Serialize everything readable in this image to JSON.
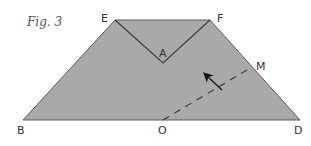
{
  "figure": {
    "caption": "Fig. 3",
    "colors": {
      "fill": "#a9a9a9",
      "edge": "#5a5a5a",
      "notch": "#3d3d3d",
      "dashed": "#333333",
      "arrow": "#111111",
      "label": "#333333",
      "background": "#ffffff"
    },
    "points": {
      "E": {
        "label": "E",
        "x": 115,
        "y": 20
      },
      "F": {
        "label": "F",
        "x": 210,
        "y": 20
      },
      "A": {
        "label": "A",
        "x": 163,
        "y": 63
      },
      "B": {
        "label": "B",
        "x": 23,
        "y": 120
      },
      "D": {
        "label": "D",
        "x": 300,
        "y": 120
      },
      "M": {
        "label": "M",
        "x": 252,
        "y": 67
      },
      "O": {
        "label": "O",
        "x": 163,
        "y": 120
      }
    },
    "shape": "trapezoid E-F-D-B with V-notch E-A-F",
    "dashed_line": {
      "from": "O",
      "to": "M"
    },
    "arrow": {
      "description": "arrow crossing dashed line OM, pointing up-left",
      "from": [
        222,
        90
      ],
      "to": [
        205,
        74
      ]
    }
  }
}
